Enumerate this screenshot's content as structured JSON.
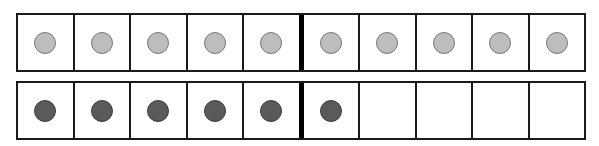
{
  "colors": {
    "light_counter": "#bdbdbd",
    "dark_counter": "#5a5a5a",
    "line": "#1a1a1a",
    "background": "#ffffff"
  },
  "frames": [
    {
      "name": "top-ten-frame",
      "cells": [
        "light",
        "light",
        "light",
        "light",
        "light",
        "light",
        "light",
        "light",
        "light",
        "light"
      ],
      "filled_count": 10
    },
    {
      "name": "bottom-ten-frame",
      "cells": [
        "dark",
        "dark",
        "dark",
        "dark",
        "dark",
        "dark",
        "empty",
        "empty",
        "empty",
        "empty"
      ],
      "filled_count": 6
    }
  ]
}
